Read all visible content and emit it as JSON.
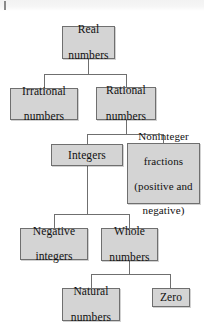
{
  "diagram": {
    "type": "hierarchy-tree",
    "box_fill": "#d4d4d4",
    "box_border": "#6f6f6f",
    "connector_color": "#6f6f6f",
    "background": "#ffffff",
    "nodes": [
      {
        "id": "real",
        "label": "Real\nnumbers",
        "line1": "Real",
        "line2": "numbers",
        "level": 0
      },
      {
        "id": "irrational",
        "label": "Irrational\nnumbers",
        "line1": "Irrational",
        "line2": "numbers",
        "level": 1
      },
      {
        "id": "rational",
        "label": "Rational\nnumbers",
        "line1": "Rational",
        "line2": "numbers",
        "level": 1
      },
      {
        "id": "integers",
        "label": "Integers",
        "line1": "Integers",
        "line2": "",
        "level": 2
      },
      {
        "id": "noninteger",
        "label": "Noninteger\nfractions\n(positive and\nnegative)",
        "line1": "Noninteger",
        "line2": "fractions",
        "line3": "(positive and",
        "line4": "negative)",
        "level": 2
      },
      {
        "id": "negative",
        "label": "Negative\nintegers",
        "line1": "Negative",
        "line2": "integers",
        "level": 3
      },
      {
        "id": "whole",
        "label": "Whole\nnumbers",
        "line1": "Whole",
        "line2": "numbers",
        "level": 3
      },
      {
        "id": "natural",
        "label": "Natural\nnumbers",
        "line1": "Natural",
        "line2": "numbers",
        "level": 4
      },
      {
        "id": "zero",
        "label": "Zero",
        "line1": "Zero",
        "line2": "",
        "level": 4
      }
    ],
    "edges": [
      {
        "from": "real",
        "to": "irrational"
      },
      {
        "from": "real",
        "to": "rational"
      },
      {
        "from": "rational",
        "to": "integers"
      },
      {
        "from": "rational",
        "to": "noninteger"
      },
      {
        "from": "integers",
        "to": "negative"
      },
      {
        "from": "integers",
        "to": "whole"
      },
      {
        "from": "whole",
        "to": "natural"
      },
      {
        "from": "whole",
        "to": "zero"
      }
    ]
  }
}
